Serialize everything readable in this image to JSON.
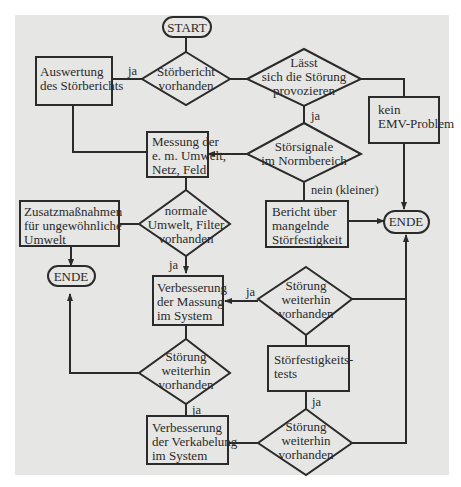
{
  "diagram": {
    "type": "flowchart",
    "nodes": {
      "start": {
        "label": "START"
      },
      "d_report": {
        "lines": [
          "Störbericht",
          "vorhanden"
        ]
      },
      "p_evaluate": {
        "lines": [
          "Auswertung",
          "des Störberichts"
        ]
      },
      "d_provoke": {
        "lines": [
          "Lässt",
          "sich die Störung",
          "provozieren"
        ]
      },
      "p_no_emc": {
        "lines": [
          "kein",
          "EMV-Problem"
        ]
      },
      "p_measure": {
        "lines": [
          "Messung der",
          "e. m. Umwelt,",
          "Netz, Feld"
        ]
      },
      "d_norm": {
        "lines": [
          "Störsignale",
          "im Normbereich"
        ]
      },
      "d_env": {
        "lines": [
          "normale",
          "Umwelt, Filter",
          "vorhanden"
        ]
      },
      "p_extra": {
        "lines": [
          "Zusatzmaßnahmen",
          "für ungewöhnliche",
          "Umwelt"
        ]
      },
      "end_left": {
        "label": "ENDE"
      },
      "p_report_bad": {
        "lines": [
          "Bericht über",
          "mangelnde",
          "Störfestigkeit"
        ]
      },
      "end_right": {
        "label": "ENDE"
      },
      "p_grounding": {
        "lines": [
          "Verbesserung",
          "der Massung",
          "im System"
        ]
      },
      "d_still1": {
        "lines": [
          "Störung",
          "weiterhin",
          "vorhanden"
        ]
      },
      "d_still_right": {
        "lines": [
          "Störung",
          "weiterhin",
          "vorhanden"
        ]
      },
      "p_tests": {
        "lines": [
          "Störfestigkeits-",
          "tests"
        ]
      },
      "p_cabling": {
        "lines": [
          "Verbesserung",
          "der Verkabelung",
          "im System"
        ]
      },
      "d_still_bottom": {
        "lines": [
          "Störung",
          "weiterhin",
          "vorhanden"
        ]
      }
    },
    "edge_labels": {
      "report_yes": "ja",
      "provoke_yes": "ja",
      "norm_no": "nein (kleiner)",
      "env_yes": "ja",
      "still_right_yes": "ja",
      "still1_yes": "ja",
      "tests_yes": "ja"
    },
    "colors": {
      "background": "#e6e6e4",
      "line": "#2b2b2b",
      "page": "#ffffff"
    }
  }
}
